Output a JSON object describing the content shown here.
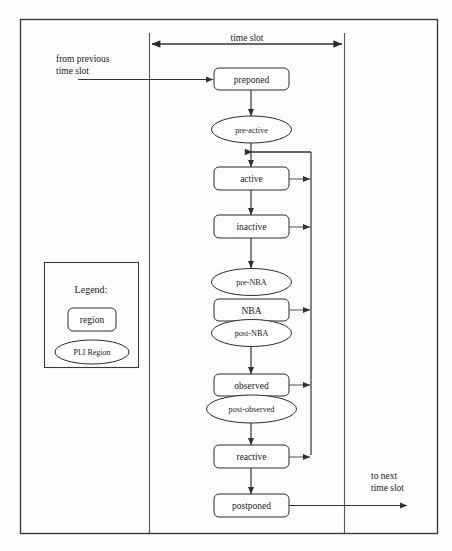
{
  "diagram": {
    "title": "time slot",
    "annotations": {
      "time_slot": "time slot",
      "from_previous_line1": "from previous",
      "from_previous_line2": "time slot",
      "to_next_line1": "to next",
      "to_next_line2": "time slot"
    },
    "nodes": [
      {
        "id": "preponed",
        "label": "preponed",
        "shape": "region"
      },
      {
        "id": "pre-active",
        "label": "pre-active",
        "shape": "pli"
      },
      {
        "id": "active",
        "label": "active",
        "shape": "region"
      },
      {
        "id": "inactive",
        "label": "inactive",
        "shape": "region"
      },
      {
        "id": "pre-nba",
        "label": "pre-NBA",
        "shape": "pli"
      },
      {
        "id": "nba",
        "label": "NBA",
        "shape": "region"
      },
      {
        "id": "post-nba",
        "label": "post-NBA",
        "shape": "pli"
      },
      {
        "id": "observed",
        "label": "observed",
        "shape": "region"
      },
      {
        "id": "post-observed",
        "label": "post-observed",
        "shape": "pli"
      },
      {
        "id": "reactive",
        "label": "reactive",
        "shape": "region"
      },
      {
        "id": "postponed",
        "label": "postponed",
        "shape": "region"
      }
    ],
    "legend": {
      "title": "Legend:",
      "region_label": "region",
      "pli_label": "PLI Region"
    },
    "colors": {
      "stroke": "#2b2b2b",
      "frame": "#3a3a3a",
      "fill": "#ffffff",
      "text": "#1a1a1a"
    }
  }
}
